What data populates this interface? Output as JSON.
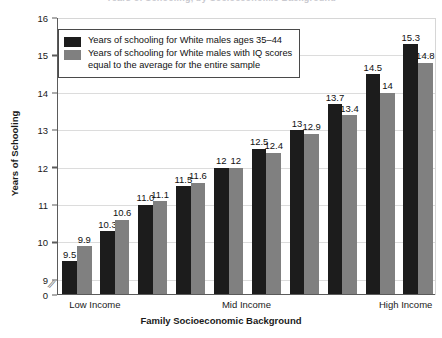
{
  "chart_data": {
    "type": "bar",
    "title": "Years of Schooling, by Socioeconomic Background",
    "xlabel": "Family Socioeconomic Background",
    "ylabel": "Years of Schooling",
    "ylim": [
      9,
      16
    ],
    "y_axis_break": true,
    "y_axis_break_symbol": "//",
    "yticks": [
      "0",
      "9",
      "10",
      "11",
      "12",
      "13",
      "14",
      "15",
      "16"
    ],
    "grid": true,
    "legend_position": "upper-left inside plot",
    "categories": [
      "1",
      "2",
      "3",
      "4",
      "5",
      "6",
      "7",
      "8",
      "9",
      "10"
    ],
    "group_labels": [
      "Low Income",
      "Mid Income",
      "High Income"
    ],
    "series": [
      {
        "name": "Years of schooling for White males ages 35–44",
        "color": "#1c1c1c",
        "values": [
          9.5,
          10.3,
          11.0,
          11.5,
          12,
          12.5,
          13,
          13.7,
          14.5,
          15.3
        ],
        "labels": [
          "9.5",
          "10.3",
          "11.0",
          "11.5",
          "12",
          "12.5",
          "13",
          "13.7",
          "14.5",
          "15.3"
        ]
      },
      {
        "name": "Years of schooling for White males with IQ scores equal to the average for the entire sample",
        "color": "#808080",
        "values": [
          9.9,
          10.6,
          11.1,
          11.6,
          12,
          12.4,
          12.9,
          13.4,
          14,
          14.8
        ],
        "labels": [
          "9.9",
          "10.6",
          "11.1",
          "11.6",
          "12",
          "12.4",
          "12.9",
          "13.4",
          "14",
          "14.8"
        ]
      }
    ]
  },
  "legend": {
    "entries": [
      {
        "line1": "Years of schooling for White males ages 35–44",
        "line2": ""
      },
      {
        "line1": "Years of schooling for White males with IQ scores",
        "line2": "equal to the average for the entire sample"
      }
    ]
  },
  "axes": {
    "y_title": "Years of Schooling",
    "x_title": "Family Socioeconomic Background"
  }
}
